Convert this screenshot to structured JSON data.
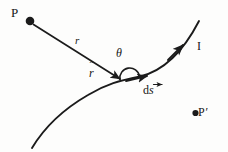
{
  "figure": {
    "background_color": "#fdfdfc",
    "ink_color": "#1b1b1b",
    "width": 228,
    "height": 152
  },
  "labels": {
    "source_point": "P",
    "distance_vector": "r",
    "angle": "θ",
    "current": "I",
    "unit_vector_symbol": "r",
    "unit_vector_hat": "ˆ",
    "element_prefix": "d",
    "element_symbol": "s",
    "field_point": "P",
    "field_point_prime": "′"
  },
  "geometry": {
    "point_P": {
      "x": 30,
      "y": 21,
      "radius": 4.2
    },
    "point_Pprime": {
      "x": 195,
      "y": 113,
      "radius": 3.2
    },
    "vector_r_start": {
      "x": 33,
      "y": 24
    },
    "vector_r_end": {
      "x": 121,
      "y": 80
    },
    "wire_vertex": {
      "x": 128,
      "y": 81
    },
    "ds_arrow_end": {
      "x": 148,
      "y": 76
    },
    "current_arrow_on_curve": {
      "x": 181,
      "y": 48
    },
    "angle_arc_center": {
      "x": 130,
      "y": 80
    },
    "angle_arc_radius": 10,
    "curve_path": "M 32,148 C 44,128 62,110 88,95 C 108,83 122,80 140,76 C 162,70 182,54 198,22"
  },
  "colors": {
    "ink": "#1b1b1b",
    "background": "#fdfdfc"
  }
}
